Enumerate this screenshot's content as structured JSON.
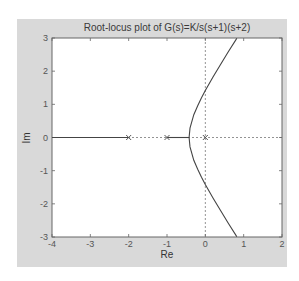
{
  "chart_data": {
    "type": "line",
    "title": "Root-locus plot of G(s)=K/s(s+1)(s+2)",
    "xlabel": "Re",
    "ylabel": "Im",
    "xlim": [
      -4,
      2
    ],
    "ylim": [
      -3,
      3
    ],
    "xticks": [
      -4,
      -3,
      -2,
      -1,
      0,
      1,
      2
    ],
    "yticks": [
      -3,
      -2,
      -1,
      0,
      1,
      2,
      3
    ],
    "grid": "dashed axes lines at Re=0 and Im=0",
    "poles": [
      {
        "re": 0,
        "im": 0
      },
      {
        "re": -1,
        "im": 0
      },
      {
        "re": -2,
        "im": 0
      }
    ],
    "series": [
      {
        "name": "real-axis branch (-inf to -2)",
        "x": [
          -4,
          -2
        ],
        "y": [
          0,
          0
        ]
      },
      {
        "name": "real-axis branch (-1 to -0.42)",
        "x": [
          -1,
          -0.423
        ],
        "y": [
          0,
          0
        ]
      },
      {
        "name": "upper complex branch",
        "x": [
          -0.423,
          -0.4,
          -0.3,
          -0.2,
          -0.1,
          0,
          0.2,
          0.4,
          0.6,
          0.8,
          0.82
        ],
        "y": [
          0,
          0.283,
          0.686,
          0.959,
          1.196,
          1.414,
          1.822,
          2.209,
          2.585,
          2.953,
          2.99
        ]
      },
      {
        "name": "lower complex branch",
        "x": [
          -0.423,
          -0.4,
          -0.3,
          -0.2,
          -0.1,
          0,
          0.2,
          0.4,
          0.6,
          0.8,
          0.82
        ],
        "y": [
          0,
          -0.283,
          -0.686,
          -0.959,
          -1.196,
          -1.414,
          -1.822,
          -2.209,
          -2.585,
          -2.953,
          -2.99
        ]
      }
    ],
    "annotations": {
      "breakaway_point": {
        "re": -0.42,
        "im": 0
      },
      "imag_axis_crossing": {
        "re": 0,
        "im": 1.414
      }
    }
  }
}
